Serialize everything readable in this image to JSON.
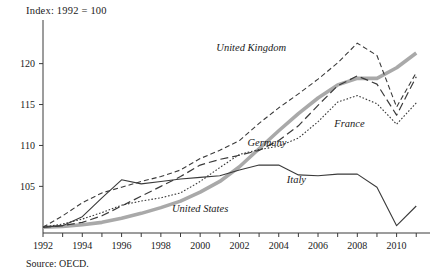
{
  "chart_data": {
    "type": "line",
    "title": "Index: 1992 = 100",
    "subtitle": "",
    "source": "Source: OECD.",
    "xlabel": "",
    "ylabel": "",
    "xlim": [
      1992,
      2011.7
    ],
    "ylim": [
      99.3,
      124.6
    ],
    "grid": false,
    "legend_position": "inline-annotations",
    "yticks": [
      105,
      110,
      115,
      120
    ],
    "ytick_labels": [
      "105",
      "110",
      "115",
      "120"
    ],
    "xticks": [
      1992,
      1994,
      1996,
      1998,
      2000,
      2002,
      2004,
      2006,
      2008,
      2010
    ],
    "xtick_labels": [
      "1992",
      "1994",
      "1996",
      "1998",
      "2000",
      "2002",
      "2004",
      "2006",
      "2008",
      "2010"
    ],
    "x": [
      1992,
      1993,
      1994,
      1995,
      1996,
      1997,
      1998,
      1999,
      2000,
      2001,
      2002,
      2003,
      2004,
      2005,
      2006,
      2007,
      2008,
      2009,
      2010,
      2011
    ],
    "series": [
      {
        "name": "United States",
        "label": "United States",
        "style": "thick-solid-gray",
        "color": "#a9a9a9",
        "width": 3.6,
        "dash": "none",
        "label_x": 2000.0,
        "label_y": 101.9,
        "values": [
          100.0,
          100.1,
          100.3,
          100.6,
          101.1,
          101.7,
          102.4,
          103.2,
          104.3,
          105.6,
          107.4,
          109.6,
          111.8,
          113.9,
          115.8,
          117.4,
          118.2,
          118.2,
          119.5,
          121.3
        ]
      },
      {
        "name": "United Kingdom",
        "label": "United Kingdom",
        "style": "short-dash",
        "color": "#3a3a3a",
        "width": 1.1,
        "dash": "5,3",
        "label_x": 2002.6,
        "label_y": 121.6,
        "values": [
          100.0,
          101.4,
          103.0,
          104.2,
          104.9,
          105.6,
          106.2,
          107.0,
          108.4,
          109.4,
          110.6,
          112.7,
          114.6,
          116.3,
          118.1,
          120.1,
          122.5,
          121.0,
          114.7,
          118.9
        ]
      },
      {
        "name": "Germany",
        "label": "Germany",
        "style": "long-dash",
        "color": "#3a3a3a",
        "width": 1.2,
        "dash": "8,4",
        "label_x": 2003.4,
        "label_y": 109.9,
        "values": [
          100.0,
          100.2,
          100.6,
          101.4,
          102.6,
          103.8,
          105.0,
          106.2,
          107.6,
          108.3,
          108.8,
          109.4,
          110.6,
          112.4,
          114.9,
          117.3,
          118.5,
          117.5,
          113.7,
          118.4
        ]
      },
      {
        "name": "France",
        "label": "France",
        "style": "dotted",
        "color": "#3a3a3a",
        "width": 1.1,
        "dash": "1.6,1.8",
        "label_x": 2007.6,
        "label_y": 112.3,
        "values": [
          100.0,
          100.4,
          101.0,
          101.8,
          102.7,
          103.2,
          103.6,
          104.2,
          105.6,
          107.3,
          108.9,
          109.5,
          109.9,
          110.9,
          112.9,
          115.3,
          116.1,
          115.1,
          112.6,
          115.2
        ]
      },
      {
        "name": "Italy",
        "label": "Italy",
        "style": "thin-solid",
        "color": "#3a3a3a",
        "width": 1.1,
        "dash": "none",
        "label_x": 2004.9,
        "label_y": 105.4,
        "values": [
          100.0,
          100.2,
          101.3,
          103.6,
          105.8,
          105.3,
          105.6,
          105.9,
          106.1,
          106.3,
          107.0,
          107.6,
          107.6,
          106.4,
          106.3,
          106.5,
          106.5,
          104.9,
          100.2,
          102.6
        ]
      }
    ]
  }
}
